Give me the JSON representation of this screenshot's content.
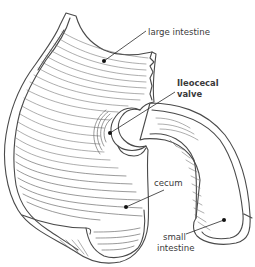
{
  "figure": {
    "line_color": "#4a4a4a",
    "label_color": "#3a3a3a",
    "labels": [
      {
        "id": "large-intestine",
        "lines": [
          "large intestine"
        ],
        "bold": false
      },
      {
        "id": "ileocecal-valve",
        "lines": [
          "Ileocecal",
          "valve"
        ],
        "bold": true
      },
      {
        "id": "cecum",
        "lines": [
          "cecum"
        ],
        "bold": false
      },
      {
        "id": "small-intestine",
        "lines": [
          "small",
          "intestine"
        ],
        "bold": false
      }
    ]
  }
}
